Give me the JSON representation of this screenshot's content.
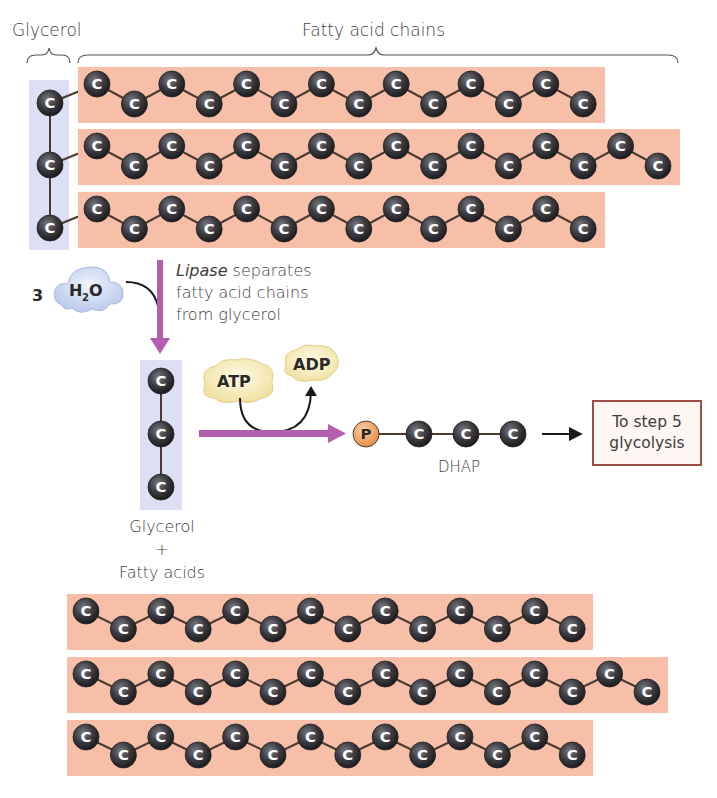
{
  "labels": {
    "glycerol_top": "Glycerol",
    "fatty_acid_chains": "Fatty acid chains",
    "water_coefficient": "3",
    "water_formula_h": "H",
    "water_formula_sub": "2",
    "water_formula_o": "O",
    "lipase_italic": "Lipase",
    "lipase_rest": " separates fatty acid chains from glycerol",
    "products_glycerol": "Glycerol",
    "products_plus": "+",
    "products_fatty_acids": "Fatty acids",
    "atp": "ATP",
    "adp": "ADP",
    "phosphate": "P",
    "dhap": "DHAP",
    "step_box": "To step 5 glycolysis",
    "carbon": "C"
  },
  "colors": {
    "chain_band": "#f8bfa8",
    "glycerol_band": "#dde0f5",
    "carbon_atom": "#3b3b40",
    "bond": "#4a3a30",
    "arrow_purple": "#b35fb0",
    "phosphate": "#f0a86a",
    "atp_blob": "#f8f0c4",
    "water_blob": "#cfdcf3",
    "step_border": "#9e4f45"
  },
  "triglyceride": {
    "glycerol_carbons": 3,
    "chains": [
      {
        "carbons": 14,
        "band_x": 78,
        "band_y": 67,
        "band_w": 527,
        "band_h": 56
      },
      {
        "carbons": 16,
        "band_x": 78,
        "band_y": 129,
        "band_w": 602,
        "band_h": 56
      },
      {
        "carbons": 14,
        "band_x": 78,
        "band_y": 192,
        "band_w": 527,
        "band_h": 56
      }
    ]
  },
  "free_fatty_acids": [
    {
      "carbons": 14,
      "band_x": 67,
      "band_y": 594,
      "band_w": 526,
      "band_h": 56
    },
    {
      "carbons": 16,
      "band_x": 67,
      "band_y": 657,
      "band_w": 601,
      "band_h": 56
    },
    {
      "carbons": 14,
      "band_x": 67,
      "band_y": 720,
      "band_w": 526,
      "band_h": 56
    }
  ],
  "dhap_carbons": 3
}
